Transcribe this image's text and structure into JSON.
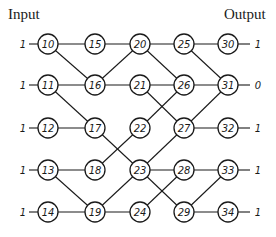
{
  "labels": {
    "input": "Input",
    "output": "Output"
  },
  "layout": {
    "columns_x": [
      48,
      95,
      140,
      184,
      228
    ],
    "rows_y": [
      44,
      85,
      128,
      170,
      212
    ],
    "node_radius": 10
  },
  "inputs": [
    "1",
    "1",
    "1",
    "1",
    "1"
  ],
  "outputs": [
    "1",
    "0",
    "1",
    "1",
    "1"
  ],
  "nodes": [
    {
      "id": "10",
      "col": 0,
      "row": 0
    },
    {
      "id": "11",
      "col": 0,
      "row": 1
    },
    {
      "id": "12",
      "col": 0,
      "row": 2
    },
    {
      "id": "13",
      "col": 0,
      "row": 3
    },
    {
      "id": "14",
      "col": 0,
      "row": 4
    },
    {
      "id": "15",
      "col": 1,
      "row": 0
    },
    {
      "id": "16",
      "col": 1,
      "row": 1
    },
    {
      "id": "17",
      "col": 1,
      "row": 2
    },
    {
      "id": "18",
      "col": 1,
      "row": 3
    },
    {
      "id": "19",
      "col": 1,
      "row": 4
    },
    {
      "id": "20",
      "col": 2,
      "row": 0
    },
    {
      "id": "21",
      "col": 2,
      "row": 1
    },
    {
      "id": "22",
      "col": 2,
      "row": 2
    },
    {
      "id": "23",
      "col": 2,
      "row": 3
    },
    {
      "id": "24",
      "col": 2,
      "row": 4
    },
    {
      "id": "25",
      "col": 3,
      "row": 0
    },
    {
      "id": "26",
      "col": 3,
      "row": 1
    },
    {
      "id": "27",
      "col": 3,
      "row": 2
    },
    {
      "id": "28",
      "col": 3,
      "row": 3
    },
    {
      "id": "29",
      "col": 3,
      "row": 4
    },
    {
      "id": "30",
      "col": 4,
      "row": 0
    },
    {
      "id": "31",
      "col": 4,
      "row": 1
    },
    {
      "id": "32",
      "col": 4,
      "row": 2
    },
    {
      "id": "33",
      "col": 4,
      "row": 3
    },
    {
      "id": "34",
      "col": 4,
      "row": 4
    }
  ],
  "edges": [
    [
      "10",
      "15"
    ],
    [
      "10",
      "16"
    ],
    [
      "11",
      "16"
    ],
    [
      "11",
      "17"
    ],
    [
      "12",
      "17"
    ],
    [
      "13",
      "18"
    ],
    [
      "13",
      "19"
    ],
    [
      "14",
      "19"
    ],
    [
      "15",
      "20"
    ],
    [
      "16",
      "20"
    ],
    [
      "16",
      "21"
    ],
    [
      "17",
      "23"
    ],
    [
      "18",
      "22"
    ],
    [
      "19",
      "23"
    ],
    [
      "19",
      "24"
    ],
    [
      "20",
      "25"
    ],
    [
      "20",
      "26"
    ],
    [
      "21",
      "26"
    ],
    [
      "21",
      "27"
    ],
    [
      "22",
      "26"
    ],
    [
      "23",
      "27"
    ],
    [
      "23",
      "28"
    ],
    [
      "23",
      "29"
    ],
    [
      "24",
      "28"
    ],
    [
      "25",
      "30"
    ],
    [
      "25",
      "31"
    ],
    [
      "26",
      "31"
    ],
    [
      "27",
      "31"
    ],
    [
      "27",
      "32"
    ],
    [
      "28",
      "33"
    ],
    [
      "29",
      "33"
    ],
    [
      "29",
      "34"
    ]
  ]
}
